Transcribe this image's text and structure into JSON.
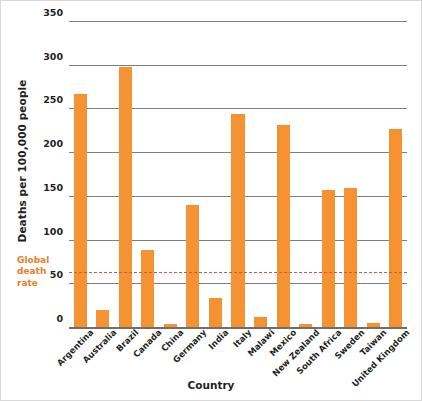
{
  "chart_data": {
    "type": "bar",
    "title": "",
    "xlabel": "Country",
    "ylabel": "Deaths per 100,000 people",
    "categories": [
      "Argentina",
      "Australia",
      "Brazil",
      "Canada",
      "China",
      "Germany",
      "India",
      "Italy",
      "Malawi",
      "Mexico",
      "New Zealand",
      "South Africa",
      "Sweden",
      "Taiwan",
      "United Kingdom"
    ],
    "values": [
      266,
      20,
      297,
      88,
      3,
      139,
      33,
      244,
      11,
      231,
      4,
      157,
      159,
      5,
      226
    ],
    "ylim": [
      0,
      350
    ],
    "yticks": [
      0,
      50,
      100,
      150,
      200,
      250,
      300,
      350
    ],
    "ytick_labels": [
      "0",
      "50",
      "100",
      "150",
      "200",
      "250",
      "300",
      "350"
    ],
    "grid": true,
    "legend": false,
    "bar_color": "#f59332",
    "annotations": [
      {
        "name": "global-death-rate",
        "label": "Global death rate",
        "label_lines": [
          "Global",
          "death",
          "rate"
        ],
        "value": 63,
        "style": "dashed-horizontal-line",
        "color": "#d2544a",
        "label_color": "#f07b28"
      }
    ]
  },
  "axis": {
    "y_title": "Deaths per 100,000 people",
    "x_title": "Country",
    "y_ticks": [
      "350",
      "300",
      "250",
      "200",
      "150",
      "100",
      "50",
      "0"
    ]
  }
}
